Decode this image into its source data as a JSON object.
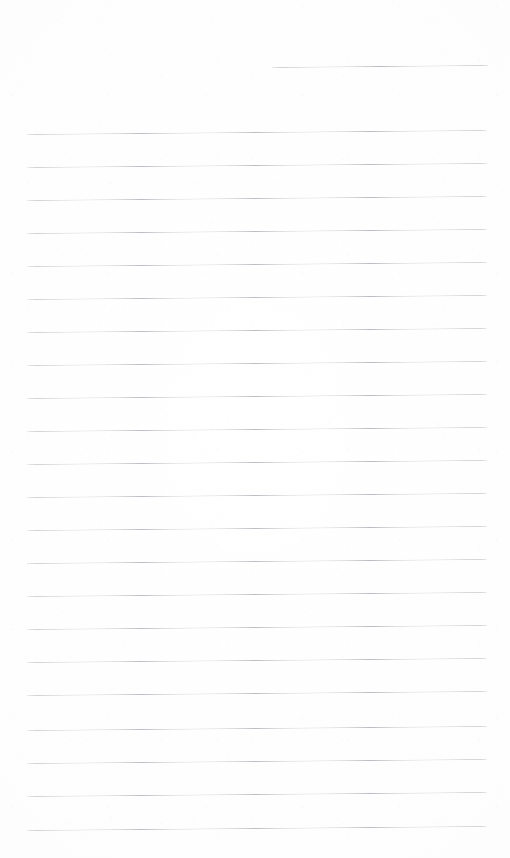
{
  "document": {
    "kind": "scanned-lined-notebook-page",
    "title": "Blank Lined Notebook Page",
    "page_width": 510,
    "page_height": 858,
    "background_color": "#fefefe",
    "rule_color": "#b9bdc2",
    "text_content": "",
    "handwriting_present": false,
    "line_count": 22,
    "line_spacing_px": 33,
    "scan_skew_degrees": -0.5
  },
  "rules": [
    {
      "name": "header-rule",
      "y": 67,
      "x": 272,
      "width": 216,
      "short": true
    },
    {
      "name": "rule-01",
      "y": 134,
      "x": 27,
      "width": 460,
      "short": false
    },
    {
      "name": "rule-02",
      "y": 167,
      "x": 27,
      "width": 460,
      "short": false
    },
    {
      "name": "rule-03",
      "y": 200,
      "x": 27,
      "width": 460,
      "short": false
    },
    {
      "name": "rule-04",
      "y": 233,
      "x": 27,
      "width": 460,
      "short": false
    },
    {
      "name": "rule-05",
      "y": 266,
      "x": 27,
      "width": 460,
      "short": false
    },
    {
      "name": "rule-06",
      "y": 299,
      "x": 27,
      "width": 460,
      "short": false
    },
    {
      "name": "rule-07",
      "y": 332,
      "x": 27,
      "width": 460,
      "short": false
    },
    {
      "name": "rule-08",
      "y": 365,
      "x": 27,
      "width": 460,
      "short": false
    },
    {
      "name": "rule-09",
      "y": 398,
      "x": 27,
      "width": 460,
      "short": false
    },
    {
      "name": "rule-10",
      "y": 431,
      "x": 27,
      "width": 460,
      "short": false
    },
    {
      "name": "rule-11",
      "y": 464,
      "x": 27,
      "width": 460,
      "short": false
    },
    {
      "name": "rule-12",
      "y": 497,
      "x": 27,
      "width": 460,
      "short": false
    },
    {
      "name": "rule-13",
      "y": 530,
      "x": 27,
      "width": 460,
      "short": false
    },
    {
      "name": "rule-14",
      "y": 563,
      "x": 27,
      "width": 460,
      "short": false
    },
    {
      "name": "rule-15",
      "y": 596,
      "x": 27,
      "width": 460,
      "short": false
    },
    {
      "name": "rule-16",
      "y": 629,
      "x": 27,
      "width": 460,
      "short": false
    },
    {
      "name": "rule-17",
      "y": 662,
      "x": 27,
      "width": 460,
      "short": false
    },
    {
      "name": "rule-18",
      "y": 695,
      "x": 27,
      "width": 460,
      "short": false
    },
    {
      "name": "rule-19",
      "y": 730,
      "x": 27,
      "width": 460,
      "short": false
    },
    {
      "name": "rule-20",
      "y": 763,
      "x": 27,
      "width": 460,
      "short": false
    },
    {
      "name": "rule-21",
      "y": 796,
      "x": 27,
      "width": 460,
      "short": false
    },
    {
      "name": "rule-22",
      "y": 830,
      "x": 27,
      "width": 460,
      "short": false
    }
  ]
}
